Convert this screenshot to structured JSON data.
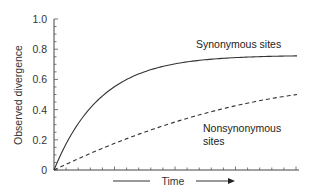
{
  "chart_data": {
    "type": "line",
    "title": "",
    "xlabel": "Time",
    "ylabel": "Observed divergence",
    "ylim": [
      0,
      1.0
    ],
    "xlim": [
      0,
      1
    ],
    "yticks": [
      "0",
      "0.2",
      "0.4",
      "0.6",
      "0.8",
      "1.0"
    ],
    "xticks_labeled": false,
    "grid": false,
    "legend": "inline annotations",
    "series": [
      {
        "name": "Synonymous sites",
        "style": "solid",
        "x": [
          0,
          0.1,
          0.2,
          0.3,
          0.4,
          0.5,
          0.6,
          0.7,
          0.8,
          0.9,
          1.0
        ],
        "values": [
          0,
          0.36,
          0.54,
          0.64,
          0.69,
          0.72,
          0.735,
          0.745,
          0.75,
          0.755,
          0.757
        ]
      },
      {
        "name": "Nonsynonymous sites",
        "style": "dashed",
        "x": [
          0,
          0.1,
          0.2,
          0.3,
          0.4,
          0.5,
          0.6,
          0.7,
          0.8,
          0.9,
          1.0
        ],
        "values": [
          0,
          0.09,
          0.16,
          0.22,
          0.28,
          0.33,
          0.37,
          0.41,
          0.44,
          0.47,
          0.5
        ]
      }
    ],
    "annotations": [
      "Synonymous sites",
      "Nonsynonymous",
      "sites"
    ]
  },
  "labels": {
    "ylabel": "Observed divergence",
    "xlabel": "Time",
    "syn": "Synonymous sites",
    "nonsyn_line1": "Nonsynonymous",
    "nonsyn_line2": "sites",
    "yticks": [
      "0",
      "0.2",
      "0.4",
      "0.6",
      "0.8",
      "1.0"
    ]
  }
}
